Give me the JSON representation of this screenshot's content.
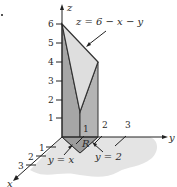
{
  "figure": {
    "type": "3d-solid-diagram",
    "colors": {
      "shadow": "#e6e6e6",
      "side_face": "#a8a8a8",
      "top_face": "#dcdcdc",
      "front_face": "#bdbdbd",
      "base_region": "#9a9a9a",
      "line": "#333333"
    }
  },
  "axes": {
    "z": {
      "label": "z",
      "ticks": [
        "1",
        "2",
        "3",
        "4",
        "5",
        "6"
      ]
    },
    "y": {
      "label": "y",
      "ticks": [
        "1",
        "2",
        "3"
      ]
    },
    "x": {
      "label": "x",
      "ticks": [
        "1",
        "2",
        "3"
      ]
    }
  },
  "annotations": {
    "surface": "z = 6 − x − y",
    "region": "R",
    "line_yx": "y = x",
    "line_y2": "y = 2"
  }
}
